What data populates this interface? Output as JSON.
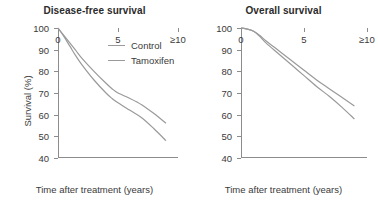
{
  "chart_data": [
    {
      "type": "line",
      "title": "Disease-free survival",
      "xlabel": "Time after treatment (years)",
      "ylabel": "Survival (%)",
      "xlim": [
        0,
        10
      ],
      "ylim": [
        40,
        100
      ],
      "yticks": [
        100,
        90,
        80,
        70,
        60,
        50,
        40
      ],
      "ytick_labels": [
        "100",
        "90",
        "80",
        "70",
        "60",
        "50",
        "40"
      ],
      "xticks": [
        0,
        5,
        10
      ],
      "xtick_labels": [
        "0",
        "5",
        "≥10"
      ],
      "grid": false,
      "legend_position": "upper-right",
      "x": [
        0,
        0.5,
        1,
        1.5,
        2,
        3,
        4,
        4.5,
        5,
        6,
        7,
        8,
        9
      ],
      "series": [
        {
          "name": "Control",
          "color": "#9a9a9a",
          "values": [
            100,
            96.5,
            93,
            89.5,
            86,
            80,
            74.5,
            72,
            70,
            67.5,
            64.5,
            60.5,
            56
          ]
        },
        {
          "name": "Tamoxifen",
          "color": "#9a9a9a",
          "values": [
            100,
            96,
            91.5,
            87,
            83,
            76,
            70,
            67.5,
            65.5,
            62,
            58.5,
            53.5,
            48
          ]
        }
      ]
    },
    {
      "type": "line",
      "title": "Overall survival",
      "xlabel": "Time after treatment (years)",
      "ylabel": "Survival (%)",
      "xlim": [
        0,
        10
      ],
      "ylim": [
        40,
        100
      ],
      "yticks": [
        100,
        90,
        80,
        70,
        60,
        50,
        40
      ],
      "ytick_labels": [
        "100",
        "90",
        "80",
        "70",
        "60",
        "50",
        "40"
      ],
      "xticks": [
        0,
        5,
        10
      ],
      "xtick_labels": [
        "0",
        "5",
        "≥10"
      ],
      "grid": false,
      "legend_position": "none",
      "x": [
        0,
        0.5,
        1,
        1.5,
        2,
        3,
        4,
        5,
        6,
        7,
        8,
        9
      ],
      "series": [
        {
          "name": "Control",
          "color": "#9a9a9a",
          "values": [
            100,
            99.5,
            98.5,
            96.5,
            94,
            89.5,
            85,
            80.5,
            76,
            72,
            68,
            64
          ]
        },
        {
          "name": "Tamoxifen",
          "color": "#9a9a9a",
          "values": [
            100,
            99.5,
            98.5,
            96,
            93,
            88,
            83,
            78,
            73,
            68.5,
            63.5,
            58
          ]
        }
      ]
    }
  ],
  "panels": [
    {
      "title": "Disease-free survival",
      "xlabel": "Time after treatment (years)",
      "ylabel": "Survival (%)",
      "ytick_labels": [
        "100",
        "90",
        "80",
        "70",
        "60",
        "50",
        "40"
      ],
      "xtick_labels": [
        "0",
        "5",
        "≥10"
      ]
    },
    {
      "title": "Overall survival",
      "xlabel": "Time after treatment (years)",
      "ylabel": "Survival (%)",
      "ytick_labels": [
        "100",
        "90",
        "80",
        "70",
        "60",
        "50",
        "40"
      ],
      "xtick_labels": [
        "0",
        "5",
        "≥10"
      ]
    }
  ],
  "legend": {
    "items": [
      {
        "label": "Control"
      },
      {
        "label": "Tamoxifen"
      }
    ]
  },
  "colors": {
    "line": "#9a9a9a",
    "axis": "#8c8c8c",
    "text": "#3a3a3a",
    "title": "#2b2b2b",
    "background": "#ffffff"
  }
}
